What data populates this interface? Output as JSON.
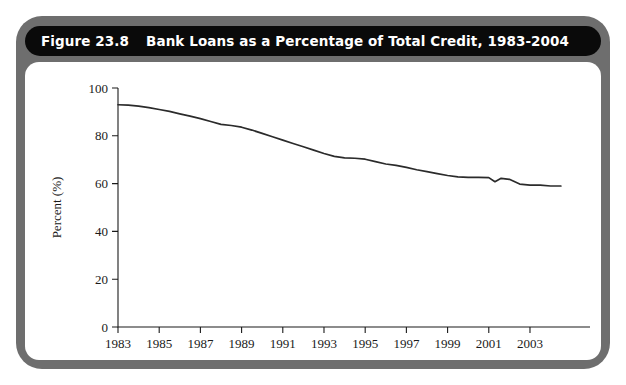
{
  "figure": {
    "number_label": "Figure 23.8",
    "title": "Bank Loans as a Percentage of Total Credit, 1983-2004",
    "frame_color": "#6e6e6e",
    "title_bar_color": "#0a0a0a",
    "panel_color": "#ffffff",
    "line_color": "#2b2b2b"
  },
  "chart_data": {
    "type": "line",
    "title": "Bank Loans as a Percentage of Total Credit, 1983-2004",
    "xlabel": "",
    "ylabel": "Percent (%)",
    "xlim": [
      1983,
      2004.7
    ],
    "ylim": [
      0,
      100
    ],
    "grid": false,
    "legend": null,
    "ytick_values": [
      0,
      20,
      40,
      60,
      80,
      100
    ],
    "ytick_labels": [
      "0",
      "20",
      "40",
      "60",
      "80",
      "100"
    ],
    "xtick_values": [
      1983,
      1985,
      1987,
      1989,
      1991,
      1993,
      1995,
      1997,
      1999,
      2001,
      2003
    ],
    "xtick_labels": [
      "1983",
      "1985",
      "1987",
      "1989",
      "1991",
      "1993",
      "1995",
      "1997",
      "1999",
      "2001",
      "2003"
    ],
    "series": [
      {
        "name": "Bank loans as a percentage of total credit",
        "x": [
          1983.0,
          1983.5,
          1984.0,
          1984.5,
          1985.0,
          1985.5,
          1986.0,
          1986.5,
          1987.0,
          1987.5,
          1988.0,
          1988.5,
          1989.0,
          1989.5,
          1990.0,
          1990.5,
          1991.0,
          1991.5,
          1992.0,
          1992.5,
          1993.0,
          1993.5,
          1994.0,
          1994.5,
          1995.0,
          1995.5,
          1996.0,
          1996.5,
          1997.0,
          1997.5,
          1998.0,
          1998.5,
          1999.0,
          1999.5,
          2000.0,
          2000.5,
          2001.0,
          2001.3,
          2001.6,
          2002.0,
          2002.5,
          2003.0,
          2003.5,
          2004.0,
          2004.5
        ],
        "y": [
          93.0,
          92.8,
          92.4,
          91.8,
          91.0,
          90.2,
          89.2,
          88.2,
          87.2,
          86.0,
          84.8,
          84.3,
          83.6,
          82.4,
          81.0,
          79.6,
          78.2,
          76.8,
          75.4,
          74.0,
          72.6,
          71.4,
          70.8,
          70.6,
          70.2,
          69.2,
          68.2,
          67.6,
          66.8,
          65.8,
          65.0,
          64.2,
          63.4,
          62.8,
          62.6,
          62.6,
          62.5,
          60.8,
          62.2,
          61.8,
          59.8,
          59.4,
          59.4,
          59.0,
          59.0
        ]
      }
    ]
  }
}
